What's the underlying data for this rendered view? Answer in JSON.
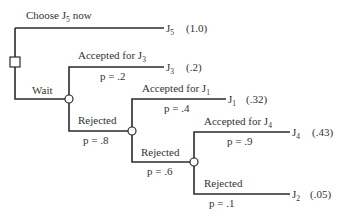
{
  "diagram": {
    "type": "decision-tree",
    "decision_node": {
      "label": "decision-node"
    },
    "branches": {
      "choose_now": {
        "label": "Choose J",
        "label_sub": "5",
        "label_tail": "now",
        "outcome": "J",
        "outcome_sub": "5",
        "value": "(1.0)"
      },
      "wait": {
        "label": "Wait"
      },
      "accept_j3": {
        "label": "Accepted for J",
        "label_sub": "3",
        "prob": "p = .2",
        "outcome": "J",
        "outcome_sub": "3",
        "value": "(.2)"
      },
      "reject_1": {
        "label": "Rejected",
        "prob": "p = .8"
      },
      "accept_j1": {
        "label": "Accepted for J",
        "label_sub": "1",
        "prob": "p = .4",
        "outcome": "J",
        "outcome_sub": "1",
        "value": "(.32)"
      },
      "reject_2": {
        "label": "Rejected",
        "prob": "p = .6"
      },
      "accept_j4": {
        "label": "Accepted for J",
        "label_sub": "4",
        "prob": "p = .9",
        "outcome": "J",
        "outcome_sub": "4",
        "value": "(.43)"
      },
      "reject_3": {
        "label": "Rejected",
        "prob": "p = .1",
        "outcome": "J",
        "outcome_sub": "2",
        "value": "(.05)"
      }
    }
  }
}
